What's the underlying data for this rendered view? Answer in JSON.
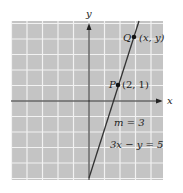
{
  "diagram": {
    "type": "coordinate-plane-line",
    "axes": {
      "x_label": "x",
      "y_label": "y"
    },
    "grid": {
      "on": true,
      "background": "#c4c4c4",
      "line_color": "#f2f2f2",
      "x_range": [
        -5,
        5
      ],
      "y_range": [
        -5,
        5
      ]
    },
    "line": {
      "equation": "3x − y = 5",
      "slope_label": "m = 3",
      "slope": 3,
      "intercept": -5
    },
    "points": [
      {
        "name": "P",
        "coords_label": "(2, 1)",
        "x": 2,
        "y": 1
      },
      {
        "name": "Q",
        "coords_label": "(x, y)",
        "x": 3,
        "y": 4
      }
    ]
  },
  "chart_data": {
    "type": "line",
    "title": "",
    "xlabel": "x",
    "ylabel": "y",
    "series": [
      {
        "name": "3x − y = 5",
        "x": [
          0,
          2,
          3,
          3.33
        ],
        "y": [
          -5,
          1,
          4,
          5
        ]
      }
    ],
    "annotations": [
      "P (2, 1)",
      "Q (x, y)",
      "m = 3",
      "3x − y = 5"
    ],
    "grid": true
  }
}
